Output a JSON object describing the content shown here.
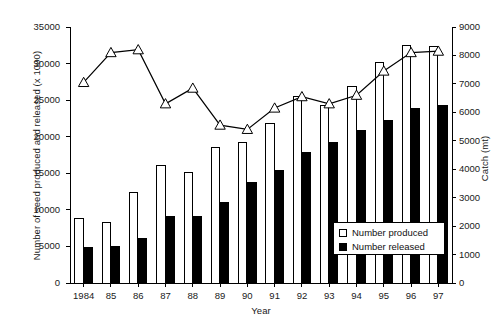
{
  "chart_data": {
    "type": "bar",
    "title": "",
    "xlabel": "Year",
    "ylabel": "Number of seed produced and released (x 1000)",
    "y2label": "Catch (mt)",
    "categories": [
      "1984",
      "85",
      "86",
      "87",
      "88",
      "89",
      "90",
      "91",
      "92",
      "93",
      "94",
      "95",
      "96",
      "97"
    ],
    "ylim": [
      0,
      35000
    ],
    "yticks": [
      0,
      5000,
      10000,
      15000,
      20000,
      25000,
      30000,
      35000
    ],
    "y2lim": [
      0,
      9000
    ],
    "y2ticks": [
      0,
      1000,
      2000,
      3000,
      4000,
      5000,
      6000,
      7000,
      8000,
      9000
    ],
    "grid": false,
    "legend_position": "bottom-right",
    "series": [
      {
        "name": "Number produced",
        "type": "bar",
        "axis": "left",
        "color": "#ffffff",
        "edge": "#000000",
        "values": [
          8800,
          8300,
          12400,
          16000,
          15100,
          18500,
          19200,
          21800,
          25500,
          24200,
          26900,
          30100,
          32500,
          32300
        ]
      },
      {
        "name": "Number released",
        "type": "bar",
        "axis": "left",
        "color": "#000000",
        "edge": "#000000",
        "values": [
          4900,
          4950,
          6050,
          9050,
          9050,
          11000,
          13800,
          15400,
          17800,
          19200,
          20800,
          22200,
          23800,
          24200
        ]
      },
      {
        "name": "Catch",
        "type": "line",
        "axis": "right",
        "marker": "triangle-up",
        "color": "#000000",
        "values": [
          7050,
          8100,
          8200,
          6300,
          6850,
          5550,
          5400,
          6150,
          6550,
          6300,
          6600,
          7450,
          8100,
          8150
        ]
      }
    ]
  },
  "axes": {
    "left_title": "Number of seed produced and released (x 1000)",
    "right_title": "Catch (mt)",
    "x_title": "Year",
    "left_ticks": [
      "35000",
      "30000",
      "25000",
      "20000",
      "15000",
      "10000",
      "5000",
      "0"
    ],
    "right_ticks": [
      "9000",
      "8000",
      "7000",
      "6000",
      "5000",
      "4000",
      "3000",
      "2000",
      "1000",
      "0"
    ],
    "x_ticks": [
      "1984",
      "85",
      "86",
      "87",
      "88",
      "89",
      "90",
      "91",
      "92",
      "93",
      "94",
      "95",
      "96",
      "97"
    ]
  },
  "legend": {
    "items": [
      {
        "label": "Number produced",
        "swatch": "open-square"
      },
      {
        "label": "Number released",
        "swatch": "filled-square"
      }
    ]
  }
}
